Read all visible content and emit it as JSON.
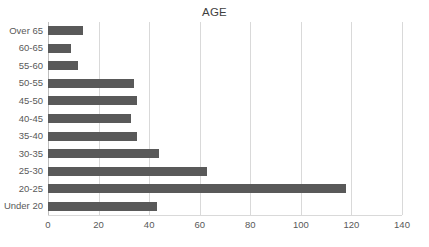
{
  "chart_data": {
    "type": "bar",
    "orientation": "horizontal",
    "title": "AGE",
    "xlabel": "",
    "ylabel": "",
    "categories": [
      "Under 20",
      "20-25",
      "25-30",
      "30-35",
      "35-40",
      "40-45",
      "45-50",
      "50-55",
      "55-60",
      "60-65",
      "Over 65"
    ],
    "values": [
      43,
      118,
      63,
      44,
      35,
      33,
      35,
      34,
      12,
      9,
      14
    ],
    "xlim": [
      0,
      140
    ],
    "xticks": [
      0,
      20,
      40,
      60,
      80,
      100,
      120,
      140
    ],
    "xtick_labels": [
      "0",
      "20",
      "40",
      "60",
      "80",
      "100",
      "120",
      "140"
    ],
    "grid": "vertical",
    "legend": "none",
    "bar_color": "#595959",
    "gridline_color": "#d9d9d9",
    "text_color": "#595959",
    "title_color": "#3f3f3f",
    "background": "#ffffff"
  }
}
